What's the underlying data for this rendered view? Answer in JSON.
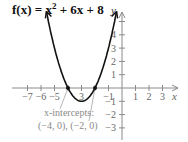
{
  "chart_data": {
    "type": "line",
    "function": "x^2 + 6x + 8",
    "xlabel": "x",
    "ylabel": "y",
    "xlim": [
      -7.5,
      3.8
    ],
    "ylim": [
      -4,
      5.5
    ],
    "x_ticks": [
      -7,
      -6,
      -5,
      -4,
      -3,
      -2,
      -1,
      1,
      2,
      3
    ],
    "x_tick_labels": [
      "−7",
      "−6",
      "−5",
      "",
      "3",
      "",
      "−1",
      "1",
      "2",
      "3"
    ],
    "y_ticks": [
      -3,
      -2,
      -1,
      1,
      2,
      3,
      4,
      5
    ],
    "y_tick_labels": [
      "−3",
      "−2",
      "−1",
      "1",
      "2",
      "3",
      "4",
      ""
    ],
    "vertex": [
      -3,
      -1
    ],
    "x_intercepts": [
      [
        -4,
        0
      ],
      [
        -2,
        0
      ]
    ],
    "points": [
      [
        -5.5,
        2.25
      ],
      [
        -5,
        3
      ],
      [
        -4,
        0
      ],
      [
        -3,
        -1
      ],
      [
        -2,
        0
      ],
      [
        -1,
        3
      ],
      [
        -0.5,
        5.25
      ]
    ],
    "annotation": {
      "line1": "x-intercepts:",
      "line2": "(−4, 0), (−2, 0)"
    },
    "grid": false,
    "colors": {
      "curve": "#111111",
      "axes": "#8a8a8a",
      "annotation": "#8a8a8a"
    }
  },
  "title": {
    "prefix": "f(x) = x",
    "exp": "2",
    "suffix": " + 6x + 8"
  },
  "labels": {
    "x": "x",
    "y": "y"
  },
  "annotation": {
    "line1": "x-intercepts:",
    "line2": "(−4, 0), (−2, 0)"
  }
}
